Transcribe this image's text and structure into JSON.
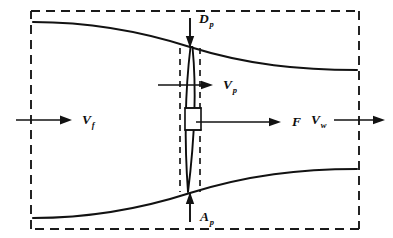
{
  "figure": {
    "kind": "propeller-slipstream-control-volume",
    "background_color": "#ffffff",
    "line_color": "#121212",
    "boundary_style": "dashed"
  },
  "labels": {
    "disk_diameter": {
      "symbol": "D",
      "subscript": "p",
      "name": "propeller-diameter"
    },
    "disk_area": {
      "symbol": "A",
      "subscript": "p",
      "name": "propeller-disk-area"
    },
    "velocity_free": {
      "symbol": "V",
      "subscript": "f",
      "name": "free-stream-velocity"
    },
    "velocity_prop": {
      "symbol": "V",
      "subscript": "p",
      "name": "propeller-plane-velocity"
    },
    "velocity_wake": {
      "symbol": "V",
      "subscript": "w",
      "name": "wake-velocity"
    },
    "thrust": {
      "symbol": "F",
      "subscript": "",
      "name": "thrust-force"
    }
  },
  "arrows": [
    {
      "id": "inflow",
      "label_key": "velocity_free",
      "direction": "right",
      "x1": 16,
      "y1": 120,
      "x2": 72,
      "y2": 120
    },
    {
      "id": "prop-plane",
      "label_key": "velocity_prop",
      "direction": "right",
      "x1": 158,
      "y1": 85,
      "x2": 212,
      "y2": 85
    },
    {
      "id": "thrust",
      "label_key": "thrust",
      "direction": "right",
      "x1": 196,
      "y1": 122,
      "x2": 281,
      "y2": 122
    },
    {
      "id": "outflow",
      "label_key": "velocity_wake",
      "direction": "right",
      "x1": 334,
      "y1": 120,
      "x2": 385,
      "y2": 120
    },
    {
      "id": "diameter-top",
      "label_key": "disk_diameter",
      "direction": "down",
      "x1": 190,
      "y1": 18,
      "x2": 190,
      "y2": 47
    },
    {
      "id": "area-bottom",
      "label_key": "disk_area",
      "direction": "up",
      "x1": 190,
      "y1": 222,
      "x2": 190,
      "y2": 193
    }
  ],
  "geometry": {
    "control_volume": {
      "x": 31,
      "y": 11,
      "width": 328,
      "height": 218
    },
    "upper_streamtube": {
      "left_y": 22,
      "right_y": 70,
      "throat_x": 190,
      "throat_y": 47
    },
    "lower_streamtube": {
      "left_y": 218,
      "right_y": 169,
      "throat_x": 190,
      "throat_y": 193
    },
    "disk_plane_x": 190,
    "inner_dashed_left_x": 180,
    "inner_dashed_right_x": 200,
    "hub": {
      "x": 185,
      "y": 108,
      "width": 16,
      "height": 22
    }
  }
}
